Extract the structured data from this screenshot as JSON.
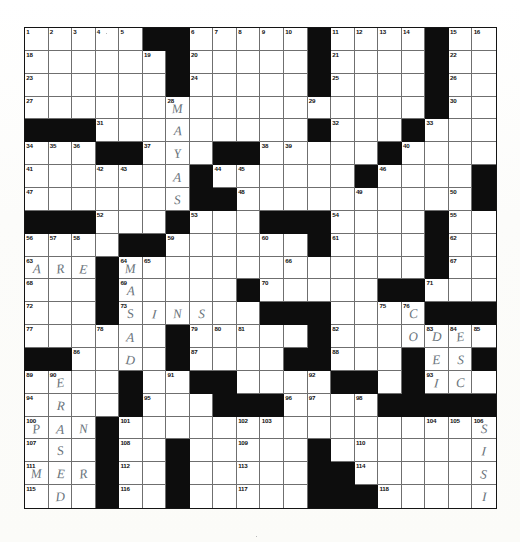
{
  "document": {
    "type": "crossword-puzzle-grid",
    "title": "Crossword Puzzle",
    "grid_columns": 20,
    "grid_rows": 21,
    "colors": {
      "block": "#0d0d0d",
      "cell": "#ffffff",
      "gridline": "#6f6f6f",
      "border": "#141414",
      "pencil": "#5e6a72"
    },
    "highest_clue_number": 118
  },
  "grid": {
    "blacks": [
      [
        1,
        6
      ],
      [
        1,
        7
      ],
      [
        1,
        13
      ],
      [
        1,
        18
      ],
      [
        2,
        7
      ],
      [
        2,
        13
      ],
      [
        2,
        18
      ],
      [
        3,
        7
      ],
      [
        3,
        13
      ],
      [
        3,
        18
      ],
      [
        4,
        18
      ],
      [
        5,
        1
      ],
      [
        5,
        2
      ],
      [
        5,
        3
      ],
      [
        5,
        13
      ],
      [
        5,
        17
      ],
      [
        6,
        4
      ],
      [
        6,
        5
      ],
      [
        6,
        9
      ],
      [
        6,
        10
      ],
      [
        6,
        16
      ],
      [
        7,
        8
      ],
      [
        7,
        15
      ],
      [
        7,
        20
      ],
      [
        8,
        8
      ],
      [
        8,
        9
      ],
      [
        8,
        20
      ],
      [
        9,
        1
      ],
      [
        9,
        2
      ],
      [
        9,
        3
      ],
      [
        9,
        7
      ],
      [
        9,
        11
      ],
      [
        9,
        12
      ],
      [
        9,
        13
      ],
      [
        9,
        18
      ],
      [
        10,
        5
      ],
      [
        10,
        6
      ],
      [
        10,
        13
      ],
      [
        10,
        18
      ],
      [
        11,
        4
      ],
      [
        11,
        18
      ],
      [
        12,
        4
      ],
      [
        12,
        10
      ],
      [
        12,
        16
      ],
      [
        12,
        17
      ],
      [
        13,
        4
      ],
      [
        13,
        11
      ],
      [
        13,
        12
      ],
      [
        13,
        13
      ],
      [
        13,
        18
      ],
      [
        13,
        19
      ],
      [
        13,
        20
      ],
      [
        14,
        7
      ],
      [
        14,
        13
      ],
      [
        15,
        1
      ],
      [
        15,
        2
      ],
      [
        15,
        7
      ],
      [
        15,
        12
      ],
      [
        15,
        13
      ],
      [
        15,
        17
      ],
      [
        15,
        20
      ],
      [
        16,
        5
      ],
      [
        16,
        8
      ],
      [
        16,
        9
      ],
      [
        16,
        14
      ],
      [
        16,
        15
      ],
      [
        16,
        17
      ],
      [
        17,
        5
      ],
      [
        17,
        9
      ],
      [
        17,
        10
      ],
      [
        17,
        11
      ],
      [
        17,
        16
      ],
      [
        17,
        17
      ],
      [
        17,
        18
      ],
      [
        17,
        19
      ],
      [
        17,
        20
      ],
      [
        18,
        4
      ],
      [
        19,
        4
      ],
      [
        19,
        7
      ],
      [
        19,
        13
      ],
      [
        20,
        4
      ],
      [
        20,
        7
      ],
      [
        20,
        13
      ],
      [
        20,
        14
      ],
      [
        21,
        4
      ],
      [
        21,
        7
      ],
      [
        21,
        13
      ],
      [
        21,
        14
      ],
      [
        21,
        15
      ]
    ],
    "numbers": [
      {
        "r": 1,
        "c": 1,
        "n": "1"
      },
      {
        "r": 1,
        "c": 2,
        "n": "2"
      },
      {
        "r": 1,
        "c": 3,
        "n": "3"
      },
      {
        "r": 1,
        "c": 4,
        "n": "4"
      },
      {
        "r": 1,
        "c": 5,
        "n": "5"
      },
      {
        "r": 1,
        "c": 8,
        "n": "6"
      },
      {
        "r": 1,
        "c": 9,
        "n": "7"
      },
      {
        "r": 1,
        "c": 10,
        "n": "8"
      },
      {
        "r": 1,
        "c": 11,
        "n": "9"
      },
      {
        "r": 1,
        "c": 12,
        "n": "10"
      },
      {
        "r": 1,
        "c": 14,
        "n": "11"
      },
      {
        "r": 1,
        "c": 15,
        "n": "12"
      },
      {
        "r": 1,
        "c": 16,
        "n": "13"
      },
      {
        "r": 1,
        "c": 17,
        "n": "14"
      },
      {
        "r": 1,
        "c": 19,
        "n": "15"
      },
      {
        "r": 1,
        "c": 20,
        "n": "16"
      },
      {
        "r": 2,
        "c": 1,
        "n": "18"
      },
      {
        "r": 2,
        "c": 6,
        "n": "19"
      },
      {
        "r": 2,
        "c": 8,
        "n": "20"
      },
      {
        "r": 2,
        "c": 14,
        "n": "21"
      },
      {
        "r": 2,
        "c": 19,
        "n": "22"
      },
      {
        "r": 3,
        "c": 1,
        "n": "23"
      },
      {
        "r": 3,
        "c": 8,
        "n": "24"
      },
      {
        "r": 3,
        "c": 14,
        "n": "25"
      },
      {
        "r": 3,
        "c": 19,
        "n": "26"
      },
      {
        "r": 4,
        "c": 1,
        "n": "27"
      },
      {
        "r": 4,
        "c": 7,
        "n": "28"
      },
      {
        "r": 4,
        "c": 13,
        "n": "29"
      },
      {
        "r": 4,
        "c": 19,
        "n": "30"
      },
      {
        "r": 5,
        "c": 4,
        "n": "31"
      },
      {
        "r": 5,
        "c": 14,
        "n": "32"
      },
      {
        "r": 5,
        "c": 18,
        "n": "33"
      },
      {
        "r": 6,
        "c": 1,
        "n": "34"
      },
      {
        "r": 6,
        "c": 2,
        "n": "35"
      },
      {
        "r": 6,
        "c": 3,
        "n": "36"
      },
      {
        "r": 6,
        "c": 6,
        "n": "37"
      },
      {
        "r": 6,
        "c": 11,
        "n": "38"
      },
      {
        "r": 6,
        "c": 12,
        "n": "39"
      },
      {
        "r": 6,
        "c": 17,
        "n": "40"
      },
      {
        "r": 7,
        "c": 1,
        "n": "41"
      },
      {
        "r": 7,
        "c": 4,
        "n": "42"
      },
      {
        "r": 7,
        "c": 5,
        "n": "43"
      },
      {
        "r": 7,
        "c": 9,
        "n": "44"
      },
      {
        "r": 7,
        "c": 10,
        "n": "45"
      },
      {
        "r": 7,
        "c": 16,
        "n": "46"
      },
      {
        "r": 8,
        "c": 1,
        "n": "47"
      },
      {
        "r": 8,
        "c": 10,
        "n": "48"
      },
      {
        "r": 8,
        "c": 15,
        "n": "49"
      },
      {
        "r": 8,
        "c": 19,
        "n": "50"
      },
      {
        "r": 8,
        "c": 20,
        "n": "51"
      },
      {
        "r": 9,
        "c": 4,
        "n": "52"
      },
      {
        "r": 9,
        "c": 8,
        "n": "53"
      },
      {
        "r": 9,
        "c": 14,
        "n": "54"
      },
      {
        "r": 9,
        "c": 19,
        "n": "55"
      },
      {
        "r": 10,
        "c": 1,
        "n": "56"
      },
      {
        "r": 10,
        "c": 2,
        "n": "57"
      },
      {
        "r": 10,
        "c": 3,
        "n": "58"
      },
      {
        "r": 10,
        "c": 7,
        "n": "59"
      },
      {
        "r": 10,
        "c": 11,
        "n": "60"
      },
      {
        "r": 10,
        "c": 14,
        "n": "61"
      },
      {
        "r": 10,
        "c": 19,
        "n": "62"
      },
      {
        "r": 11,
        "c": 1,
        "n": "63"
      },
      {
        "r": 11,
        "c": 5,
        "n": "64"
      },
      {
        "r": 11,
        "c": 6,
        "n": "65"
      },
      {
        "r": 11,
        "c": 12,
        "n": "66"
      },
      {
        "r": 11,
        "c": 19,
        "n": "67"
      },
      {
        "r": 12,
        "c": 1,
        "n": "68"
      },
      {
        "r": 12,
        "c": 5,
        "n": "69"
      },
      {
        "r": 12,
        "c": 11,
        "n": "70"
      },
      {
        "r": 12,
        "c": 18,
        "n": "71"
      },
      {
        "r": 13,
        "c": 1,
        "n": "72"
      },
      {
        "r": 13,
        "c": 5,
        "n": "73"
      },
      {
        "r": 13,
        "c": 12,
        "n": "74"
      },
      {
        "r": 13,
        "c": 16,
        "n": "75"
      },
      {
        "r": 13,
        "c": 17,
        "n": "76"
      },
      {
        "r": 14,
        "c": 1,
        "n": "77"
      },
      {
        "r": 14,
        "c": 4,
        "n": "78"
      },
      {
        "r": 14,
        "c": 8,
        "n": "79"
      },
      {
        "r": 14,
        "c": 9,
        "n": "80"
      },
      {
        "r": 14,
        "c": 10,
        "n": "81"
      },
      {
        "r": 14,
        "c": 14,
        "n": "82"
      },
      {
        "r": 14,
        "c": 18,
        "n": "83"
      },
      {
        "r": 14,
        "c": 19,
        "n": "84"
      },
      {
        "r": 14,
        "c": 20,
        "n": "85"
      },
      {
        "r": 15,
        "c": 3,
        "n": "86"
      },
      {
        "r": 15,
        "c": 8,
        "n": "87"
      },
      {
        "r": 15,
        "c": 14,
        "n": "88"
      },
      {
        "r": 16,
        "c": 1,
        "n": "89"
      },
      {
        "r": 16,
        "c": 2,
        "n": "90"
      },
      {
        "r": 16,
        "c": 7,
        "n": "91"
      },
      {
        "r": 16,
        "c": 13,
        "n": "92"
      },
      {
        "r": 16,
        "c": 18,
        "n": "93"
      },
      {
        "r": 17,
        "c": 1,
        "n": "94"
      },
      {
        "r": 17,
        "c": 6,
        "n": "95"
      },
      {
        "r": 17,
        "c": 12,
        "n": "96"
      },
      {
        "r": 17,
        "c": 13,
        "n": "97"
      },
      {
        "r": 17,
        "c": 15,
        "n": "98"
      },
      {
        "r": 17,
        "c": 16,
        "n": "99"
      },
      {
        "r": 18,
        "c": 1,
        "n": "100"
      },
      {
        "r": 18,
        "c": 5,
        "n": "101"
      },
      {
        "r": 18,
        "c": 10,
        "n": "102"
      },
      {
        "r": 18,
        "c": 11,
        "n": "103"
      },
      {
        "r": 18,
        "c": 18,
        "n": "104"
      },
      {
        "r": 18,
        "c": 19,
        "n": "105"
      },
      {
        "r": 18,
        "c": 20,
        "n": "106"
      },
      {
        "r": 19,
        "c": 1,
        "n": "107"
      },
      {
        "r": 19,
        "c": 5,
        "n": "108"
      },
      {
        "r": 19,
        "c": 10,
        "n": "109"
      },
      {
        "r": 19,
        "c": 15,
        "n": "110"
      },
      {
        "r": 20,
        "c": 1,
        "n": "111"
      },
      {
        "r": 20,
        "c": 5,
        "n": "112"
      },
      {
        "r": 20,
        "c": 10,
        "n": "113"
      },
      {
        "r": 20,
        "c": 15,
        "n": "114"
      },
      {
        "r": 21,
        "c": 1,
        "n": "115"
      },
      {
        "r": 21,
        "c": 5,
        "n": "116"
      },
      {
        "r": 21,
        "c": 10,
        "n": "117"
      },
      {
        "r": 21,
        "c": 16,
        "n": "118"
      }
    ],
    "letters": [
      {
        "r": 4,
        "c": 7,
        "l": "M"
      },
      {
        "r": 5,
        "c": 7,
        "l": "A"
      },
      {
        "r": 6,
        "c": 7,
        "l": "Y"
      },
      {
        "r": 7,
        "c": 7,
        "l": "A"
      },
      {
        "r": 8,
        "c": 7,
        "l": "S"
      },
      {
        "r": 11,
        "c": 1,
        "l": "A"
      },
      {
        "r": 11,
        "c": 2,
        "l": "R"
      },
      {
        "r": 11,
        "c": 3,
        "l": "E"
      },
      {
        "r": 11,
        "c": 5,
        "l": "M"
      },
      {
        "r": 12,
        "c": 5,
        "l": "A"
      },
      {
        "r": 13,
        "c": 5,
        "l": "S"
      },
      {
        "r": 13,
        "c": 6,
        "l": "I"
      },
      {
        "r": 13,
        "c": 7,
        "l": "N"
      },
      {
        "r": 13,
        "c": 8,
        "l": "S"
      },
      {
        "r": 14,
        "c": 5,
        "l": "A"
      },
      {
        "r": 15,
        "c": 5,
        "l": "D"
      },
      {
        "r": 16,
        "c": 5,
        "l": "A"
      },
      {
        "r": 13,
        "c": 17,
        "l": "C"
      },
      {
        "r": 14,
        "c": 17,
        "l": "O"
      },
      {
        "r": 15,
        "c": 17,
        "l": "Q"
      },
      {
        "r": 14,
        "c": 18,
        "l": "D"
      },
      {
        "r": 14,
        "c": 19,
        "l": "E"
      },
      {
        "r": 15,
        "c": 18,
        "l": "E"
      },
      {
        "r": 15,
        "c": 19,
        "l": "S"
      },
      {
        "r": 16,
        "c": 18,
        "l": "I"
      },
      {
        "r": 16,
        "c": 19,
        "l": "C"
      },
      {
        "r": 16,
        "c": 2,
        "l": "E"
      },
      {
        "r": 17,
        "c": 2,
        "l": "R"
      },
      {
        "r": 18,
        "c": 1,
        "l": "P"
      },
      {
        "r": 18,
        "c": 2,
        "l": "A"
      },
      {
        "r": 18,
        "c": 3,
        "l": "N"
      },
      {
        "r": 19,
        "c": 2,
        "l": "S"
      },
      {
        "r": 20,
        "c": 1,
        "l": "M"
      },
      {
        "r": 20,
        "c": 2,
        "l": "E"
      },
      {
        "r": 20,
        "c": 3,
        "l": "R"
      },
      {
        "r": 21,
        "c": 2,
        "l": "D"
      },
      {
        "r": 18,
        "c": 20,
        "l": "S"
      },
      {
        "r": 19,
        "c": 20,
        "l": "I"
      },
      {
        "r": 20,
        "c": 20,
        "l": "S"
      },
      {
        "r": 21,
        "c": 20,
        "l": "I"
      }
    ]
  }
}
